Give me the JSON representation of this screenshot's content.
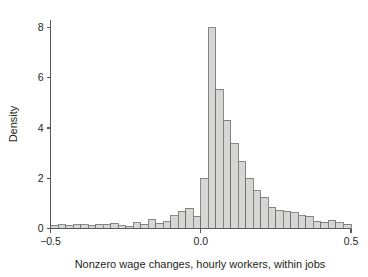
{
  "figure": {
    "background": "#ffffff",
    "bar_fill": "#d6d6d4",
    "bar_stroke": "#6d6e70",
    "axis_color": "#58595b",
    "text_color": "#231f20"
  },
  "chart_data": {
    "type": "bar",
    "subtype": "histogram",
    "title": "",
    "xlabel": "Nonzero wage changes, hourly workers, within jobs",
    "ylabel": "Density",
    "xlim": [
      -0.5,
      0.5
    ],
    "ylim": [
      0,
      8.3
    ],
    "xticks": [
      -0.5,
      0.0,
      0.5
    ],
    "xtick_labels": [
      "−0.5",
      "0.0",
      "0.5"
    ],
    "yticks": [
      0,
      2,
      4,
      6,
      8
    ],
    "ytick_labels": [
      "0",
      "2",
      "4",
      "6",
      "8"
    ],
    "grid": false,
    "legend": null,
    "bin_width": 0.025,
    "bin_left_edges": [
      -0.5,
      -0.475,
      -0.45,
      -0.425,
      -0.4,
      -0.375,
      -0.35,
      -0.325,
      -0.3,
      -0.275,
      -0.25,
      -0.225,
      -0.2,
      -0.175,
      -0.15,
      -0.125,
      -0.1,
      -0.075,
      -0.05,
      -0.025,
      0.0,
      0.025,
      0.05,
      0.075,
      0.1,
      0.125,
      0.15,
      0.175,
      0.2,
      0.225,
      0.25,
      0.275,
      0.3,
      0.325,
      0.35,
      0.375,
      0.4,
      0.425,
      0.45,
      0.475
    ],
    "bin_centers": [
      -0.4875,
      -0.4625,
      -0.4375,
      -0.4125,
      -0.3875,
      -0.3625,
      -0.3375,
      -0.3125,
      -0.2875,
      -0.2625,
      -0.2375,
      -0.2125,
      -0.1875,
      -0.1625,
      -0.1375,
      -0.1125,
      -0.0875,
      -0.0625,
      -0.0375,
      -0.0125,
      0.0125,
      0.0375,
      0.0625,
      0.0875,
      0.1125,
      0.1375,
      0.1625,
      0.1875,
      0.2125,
      0.2375,
      0.2625,
      0.2875,
      0.3125,
      0.3375,
      0.3625,
      0.3875,
      0.4125,
      0.4375,
      0.4625,
      0.4875
    ],
    "values": [
      0.12,
      0.15,
      0.13,
      0.15,
      0.14,
      0.12,
      0.17,
      0.16,
      0.2,
      0.1,
      0.08,
      0.23,
      0.17,
      0.34,
      0.21,
      0.27,
      0.5,
      0.68,
      0.8,
      0.48,
      2.0,
      8.0,
      5.55,
      4.3,
      3.37,
      2.65,
      2.0,
      1.5,
      1.25,
      0.85,
      0.72,
      0.68,
      0.62,
      0.5,
      0.48,
      0.28,
      0.25,
      0.32,
      0.22,
      0.17
    ],
    "ylabel_text": "Density"
  }
}
